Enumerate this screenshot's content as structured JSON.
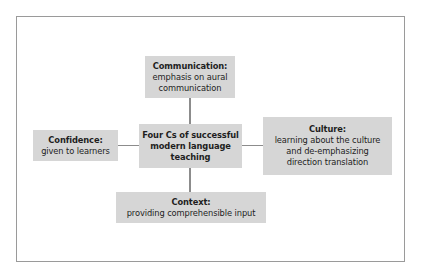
{
  "diagram": {
    "type": "concept-map",
    "center": {
      "lines": [
        "Four Cs of successful",
        "modern language",
        "teaching"
      ]
    },
    "nodes": {
      "top": {
        "title": "Communication:",
        "body": [
          "emphasis on aural",
          "communication"
        ]
      },
      "left": {
        "title": "Confidence:",
        "body": [
          "given to learners"
        ]
      },
      "right": {
        "title": "Culture:",
        "body": [
          "learning about the culture",
          "and de-emphasizing",
          "direction translation"
        ]
      },
      "bottom": {
        "title": "Context:",
        "body": [
          "providing comprehensible input"
        ]
      }
    },
    "colors": {
      "box_fill": "#d6d6d6",
      "connector": "#8c8c8c",
      "frame_border": "#9a9a9a",
      "text": "#1e1e1e"
    }
  }
}
